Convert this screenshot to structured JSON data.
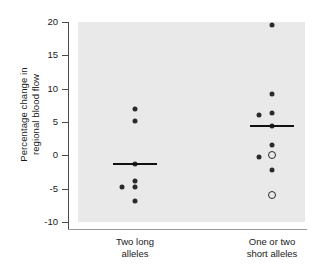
{
  "chart_data": {
    "type": "scatter",
    "title": "",
    "xlabel": "",
    "ylabel": "Percentage change in\nregional blood flow",
    "ylim": [
      -10,
      20
    ],
    "yticks": [
      20,
      15,
      10,
      5,
      0,
      -5,
      -10
    ],
    "ytick_labels": [
      "20",
      "15",
      "10",
      "5",
      "0",
      "-5",
      "-10"
    ],
    "grid": false,
    "legend": "none",
    "panel_background": "#e9e9e9",
    "point_color": "#2b2b2b",
    "mean_color": "#111111",
    "categories": [
      "Two long\nalleles",
      "One or two\nshort alleles"
    ],
    "groups": [
      {
        "name": "Two long alleles",
        "label": "Two long\nalleles",
        "mean": -1.3,
        "points": [
          {
            "value": 7.0,
            "marker": "filled",
            "offset": 0
          },
          {
            "value": 5.2,
            "marker": "filled",
            "offset": 0
          },
          {
            "value": -1.3,
            "marker": "filled",
            "offset": 0
          },
          {
            "value": -3.8,
            "marker": "filled",
            "offset": 0
          },
          {
            "value": -4.8,
            "marker": "filled",
            "offset": 0
          },
          {
            "value": -4.8,
            "marker": "filled",
            "offset": -13
          },
          {
            "value": -6.9,
            "marker": "filled",
            "offset": 0
          }
        ]
      },
      {
        "name": "One or two short alleles",
        "label": "One or two\nshort alleles",
        "mean": 4.4,
        "points": [
          {
            "value": 19.5,
            "marker": "filled",
            "offset": 0
          },
          {
            "value": 9.2,
            "marker": "filled",
            "offset": 0
          },
          {
            "value": 6.3,
            "marker": "filled",
            "offset": 0
          },
          {
            "value": 6.0,
            "marker": "filled",
            "offset": -13
          },
          {
            "value": 4.4,
            "marker": "filled",
            "offset": 0
          },
          {
            "value": 1.6,
            "marker": "filled",
            "offset": 0
          },
          {
            "value": 0.0,
            "marker": "open",
            "offset": 0
          },
          {
            "value": -0.2,
            "marker": "filled",
            "offset": -13
          },
          {
            "value": -2.2,
            "marker": "filled",
            "offset": 0
          },
          {
            "value": -5.9,
            "marker": "open",
            "offset": 0
          }
        ]
      }
    ]
  }
}
